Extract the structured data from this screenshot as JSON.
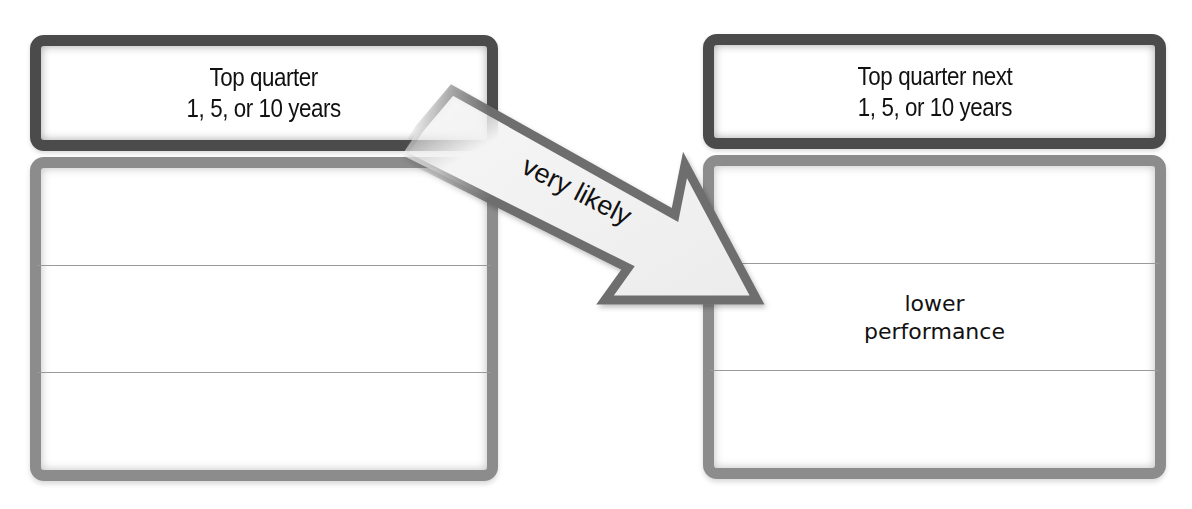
{
  "diagram": {
    "left_column": {
      "header": {
        "line1": "Top quarter",
        "line2": "1, 5, or 10 years"
      },
      "rows": [
        {
          "label": ""
        },
        {
          "label": ""
        },
        {
          "label": ""
        }
      ]
    },
    "right_column": {
      "header": {
        "line1": "Top quarter next",
        "line2": "1, 5, or 10 years"
      },
      "rows": [
        {
          "label": ""
        },
        {
          "line1": "lower",
          "line2": "performance"
        },
        {
          "label": ""
        }
      ]
    },
    "arrow": {
      "label": "very likely",
      "from": "left-header",
      "to": "right-middle-row",
      "icon": "arrow-down-right-icon"
    },
    "colors": {
      "header_border": "#4b4b4b",
      "body_border": "#8c8c8c",
      "arrow_outline": "#6e6e6e",
      "arrow_fill": "#f0f0f0",
      "divider": "#9a9a9a",
      "text": "#111111"
    }
  }
}
